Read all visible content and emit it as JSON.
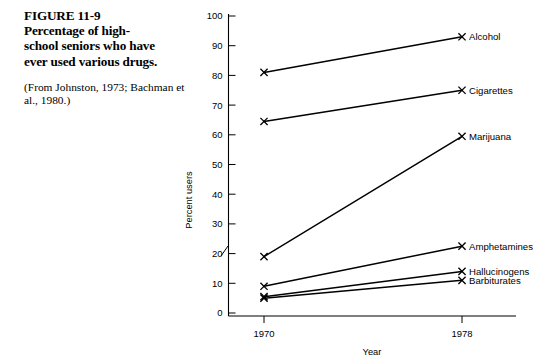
{
  "caption": {
    "title": "FIGURE 11-9 Percentage of high-school seniors who have ever used various drugs.",
    "title_lines": [
      "FIGURE 11-9",
      "Percentage of high-",
      "school seniors who have",
      "ever used various drugs."
    ],
    "source": "(From Johnston, 1973; Bachman et al., 1980.)"
  },
  "chart_data": {
    "type": "line",
    "xlabel": "Year",
    "ylabel": "Percent users",
    "x": [
      1970,
      1978
    ],
    "xtick_labels": [
      "1970",
      "1978"
    ],
    "ylim": [
      0,
      100
    ],
    "yticks": [
      0,
      10,
      20,
      30,
      40,
      50,
      60,
      70,
      80,
      90,
      100
    ],
    "ytick_labels": [
      "0",
      "10",
      "20",
      "30",
      "40",
      "50",
      "60",
      "70",
      "80",
      "90",
      "100"
    ],
    "grid": false,
    "legend_position": "right-inline-labels",
    "marker": "x",
    "axis_break": true,
    "series": [
      {
        "name": "Alcohol",
        "values": [
          81,
          93
        ]
      },
      {
        "name": "Cigarettes",
        "values": [
          64.5,
          75
        ]
      },
      {
        "name": "Marijuana",
        "values": [
          19,
          59.5
        ]
      },
      {
        "name": "Amphetamines",
        "values": [
          9,
          22.5
        ]
      },
      {
        "name": "Hallucinogens",
        "values": [
          5.5,
          14
        ]
      },
      {
        "name": "Barbiturates",
        "values": [
          5,
          11
        ]
      }
    ]
  }
}
